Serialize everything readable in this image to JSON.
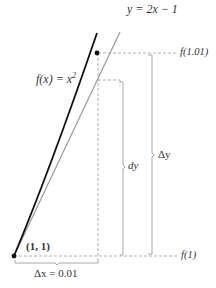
{
  "labels": {
    "tangent_eq": "y = 2x − 1",
    "curve_fn_prefix": "f(x) = x",
    "curve_fn_exp": "2",
    "f101": "f(1.01)",
    "f1": "f(1)",
    "dy": "dy",
    "delta_y": "Δy",
    "point": "(1, 1)",
    "delta_x": "Δx = 0.01"
  },
  "colors": {
    "curve": "#111111",
    "tangent": "#999999",
    "dashed": "#b0b0b0",
    "bracket": "#a8a8a8",
    "text": "#333333"
  },
  "diagram": {
    "curve": "f(x) = x^2",
    "tangent_line": "y = 2x - 1",
    "point": [
      1,
      1
    ],
    "delta_x": 0.01
  }
}
